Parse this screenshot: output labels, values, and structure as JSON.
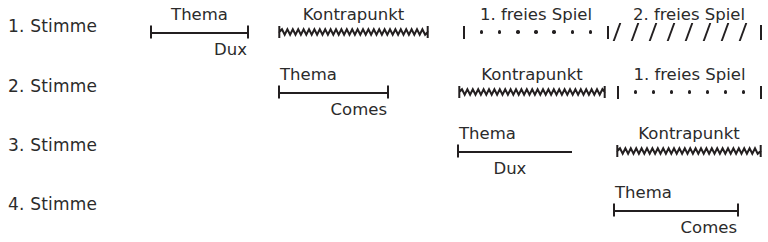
{
  "diagram": {
    "ink_color": "#231f20",
    "background_color": "#ffffff",
    "segment_styles": {
      "bracket": "horizontal-rule-with-end-ticks",
      "wavy": "zigzag-line-with-end-ticks",
      "dotted": "dotted-line-between-vertical-bars",
      "slashes": "diagonal-slashes-ending-in-vertical-bar"
    }
  },
  "rows": [
    {
      "label": "1. Stimme",
      "segments": [
        {
          "kind": "bracket",
          "top_label": "Thema",
          "bottom_label": "Dux"
        },
        {
          "kind": "wavy",
          "top_label": "Kontrapunkt",
          "bottom_label": ""
        },
        {
          "kind": "dotted",
          "top_label": "1. freies Spiel",
          "bottom_label": "",
          "dot_count": 7
        },
        {
          "kind": "slashes",
          "top_label": "2. freies Spiel",
          "bottom_label": "",
          "slash_count": 8
        }
      ]
    },
    {
      "label": "2. Stimme",
      "segments": [
        {
          "kind": "bracket",
          "top_label": "Thema",
          "bottom_label": "Comes"
        },
        {
          "kind": "wavy",
          "top_label": "Kontrapunkt",
          "bottom_label": ""
        },
        {
          "kind": "dotted",
          "top_label": "1. freies Spiel",
          "bottom_label": "",
          "dot_count": 7
        }
      ]
    },
    {
      "label": "3. Stimme",
      "segments": [
        {
          "kind": "bracket",
          "top_label": "Thema",
          "bottom_label": "Dux"
        },
        {
          "kind": "wavy",
          "top_label": "Kontrapunkt",
          "bottom_label": ""
        }
      ]
    },
    {
      "label": "4. Stimme",
      "segments": [
        {
          "kind": "bracket",
          "top_label": "Thema",
          "bottom_label": "Comes"
        }
      ]
    }
  ]
}
